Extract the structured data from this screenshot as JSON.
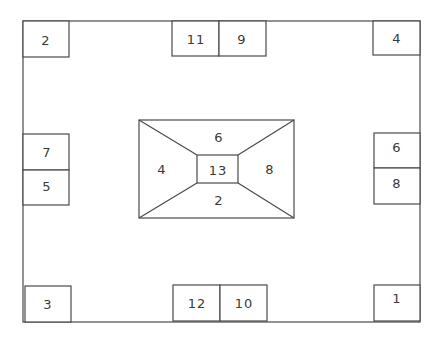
{
  "diagram": {
    "type": "floor-plan",
    "outer": {
      "x": 23,
      "y": 21,
      "w": 397,
      "h": 301
    },
    "line_color": "#4a4a4a",
    "text_color": "#3a3a3a",
    "perimeter_boxes": [
      {
        "label": "2",
        "x": 23,
        "y": 21,
        "w": 46,
        "h": 36
      },
      {
        "label": "11",
        "x": 172,
        "y": 21,
        "w": 47,
        "h": 35
      },
      {
        "label": "9",
        "x": 219,
        "y": 21,
        "w": 47,
        "h": 35
      },
      {
        "label": "4",
        "x": 373,
        "y": 21,
        "w": 47,
        "h": 34
      },
      {
        "label": "7",
        "x": 23,
        "y": 134,
        "w": 46,
        "h": 36
      },
      {
        "label": "5",
        "x": 23,
        "y": 170,
        "w": 46,
        "h": 35
      },
      {
        "label": "6",
        "x": 374,
        "y": 133,
        "w": 46,
        "h": 35
      },
      {
        "label": "8",
        "x": 374,
        "y": 168,
        "w": 46,
        "h": 36
      },
      {
        "label": "3",
        "x": 25,
        "y": 286,
        "w": 46,
        "h": 36
      },
      {
        "label": "12",
        "x": 173,
        "y": 285,
        "w": 47,
        "h": 36
      },
      {
        "label": "10",
        "x": 220,
        "y": 285,
        "w": 47,
        "h": 36
      },
      {
        "label": "1",
        "x": 374,
        "y": 285,
        "w": 46,
        "h": 36
      }
    ],
    "center": {
      "outer": {
        "x": 139,
        "y": 120,
        "w": 155,
        "h": 98
      },
      "inner": {
        "x": 197,
        "y": 155,
        "w": 41,
        "h": 28
      },
      "labels": {
        "top": "6",
        "left": "4",
        "inner": "13",
        "right": "8",
        "bottom": "2"
      }
    }
  }
}
